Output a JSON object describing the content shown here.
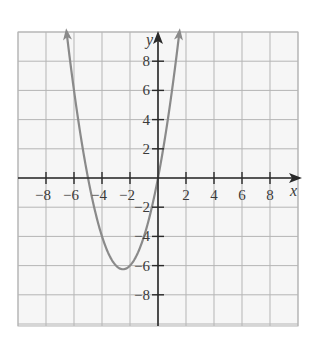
{
  "chart_data": {
    "type": "line",
    "title": "",
    "function": "y = x^2 + 5x",
    "xlabel": "x",
    "ylabel": "y",
    "xlim": [
      -10,
      10
    ],
    "ylim": [
      -10,
      10
    ],
    "grid": true,
    "grid_step": 2,
    "x_ticks": [
      -8,
      -6,
      -4,
      -2,
      2,
      4,
      6,
      8
    ],
    "x_tick_labels": [
      "−8",
      "−6",
      "−4",
      "−2",
      "2",
      "4",
      "6",
      "8"
    ],
    "y_ticks": [
      8,
      6,
      4,
      2,
      -2,
      -4,
      -6,
      -8
    ],
    "y_tick_labels": [
      "8",
      "6",
      "4",
      "2",
      "−2",
      "−4",
      "−6",
      "−8"
    ],
    "series": [
      {
        "name": "parabola",
        "color": "#8a8a8a",
        "x_range": [
          -6.53,
          1.53
        ],
        "arrows_at_ends": true,
        "key_points": [
          {
            "x": -5,
            "y": 0
          },
          {
            "x": -2.5,
            "y": -6.25
          },
          {
            "x": 0,
            "y": 0
          }
        ]
      }
    ],
    "colors": {
      "grid": "#b5b5b5",
      "axis": "#2a2a2a",
      "curve": "#8a8a8a",
      "background": "#f4f4f4"
    }
  }
}
